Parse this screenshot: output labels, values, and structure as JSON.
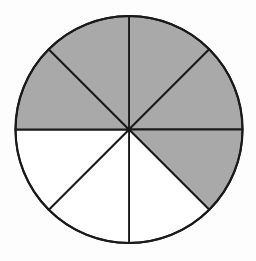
{
  "figure": {
    "type": "fraction-circle",
    "total_sectors": 8,
    "shaded_count": 5,
    "unshaded_count": 3,
    "fraction_shaded": "5/8",
    "geometry": {
      "canvas_width": 256,
      "canvas_height": 261,
      "center_x": 129,
      "center_y": 129.5,
      "radius": 113.5,
      "sector_angle_deg": 45,
      "radius_stroke_width": 1.8,
      "rim_stroke_width": 2.2
    },
    "colors": {
      "shaded": "#a9a9a9",
      "unshaded": "#ffffff",
      "outline": "#1a1a1a",
      "background": "#fdfdfd"
    },
    "sectors": [
      {
        "label": "north-to-northeast",
        "start_deg": 0,
        "end_deg": 45,
        "shaded": true
      },
      {
        "label": "northeast-to-east",
        "start_deg": 45,
        "end_deg": 90,
        "shaded": true
      },
      {
        "label": "east-to-southeast",
        "start_deg": 90,
        "end_deg": 135,
        "shaded": true
      },
      {
        "label": "southeast-to-south",
        "start_deg": 135,
        "end_deg": 180,
        "shaded": false
      },
      {
        "label": "south-to-southwest",
        "start_deg": 180,
        "end_deg": 225,
        "shaded": false
      },
      {
        "label": "southwest-to-west",
        "start_deg": 225,
        "end_deg": 270,
        "shaded": false
      },
      {
        "label": "west-to-northwest",
        "start_deg": 270,
        "end_deg": 315,
        "shaded": true
      },
      {
        "label": "northwest-to-north",
        "start_deg": 315,
        "end_deg": 360,
        "shaded": true
      }
    ]
  }
}
